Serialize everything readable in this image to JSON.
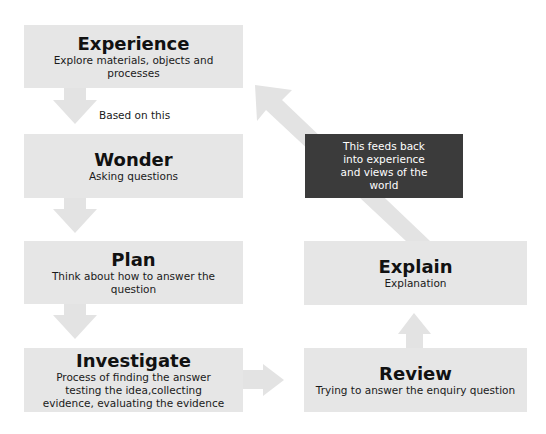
{
  "diagram": {
    "type": "flowchart",
    "colors": {
      "box_fill": "#e6e6e6",
      "arrow_fill": "#e3e3e3",
      "note_fill": "#3b3b3b",
      "note_text": "#ffffff",
      "text": "#111111"
    },
    "nodes": [
      {
        "id": "experience",
        "title": "Experience",
        "description": "Explore materials, objects and processes"
      },
      {
        "id": "wonder",
        "title": "Wonder",
        "description": "Asking questions"
      },
      {
        "id": "plan",
        "title": "Plan",
        "description": "Think about how to answer the question"
      },
      {
        "id": "investigate",
        "title": "Investigate",
        "description": "Process of finding the answer testing the idea,collecting evidence, evaluating the evidence"
      },
      {
        "id": "review",
        "title": "Review",
        "description": "Trying to answer the enquiry question"
      },
      {
        "id": "explain",
        "title": "Explain",
        "description": "Explanation"
      }
    ],
    "note": {
      "text": "This feeds back into experience and views of the world"
    },
    "edge_labels": {
      "experience_to_wonder": "Based on this"
    },
    "edges": [
      {
        "from": "experience",
        "to": "wonder",
        "direction": "down"
      },
      {
        "from": "wonder",
        "to": "plan",
        "direction": "down"
      },
      {
        "from": "plan",
        "to": "investigate",
        "direction": "down"
      },
      {
        "from": "investigate",
        "to": "review",
        "direction": "right"
      },
      {
        "from": "review",
        "to": "explain",
        "direction": "up"
      },
      {
        "from": "explain",
        "to": "experience",
        "direction": "diagonal-up-left"
      }
    ]
  }
}
